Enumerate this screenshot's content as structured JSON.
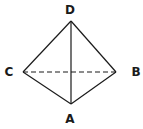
{
  "diagram": {
    "type": "tetrahedron",
    "colors": {
      "stroke": "#1a1a1a",
      "background": "#ffffff"
    },
    "vertices": [
      {
        "id": "D",
        "label": "D",
        "x": 71,
        "y": 21,
        "label_x": 70,
        "label_y": 14
      },
      {
        "id": "C",
        "label": "C",
        "x": 23,
        "y": 72,
        "label_x": 9,
        "label_y": 76
      },
      {
        "id": "B",
        "label": "B",
        "x": 116,
        "y": 72,
        "label_x": 136,
        "label_y": 76
      },
      {
        "id": "A",
        "label": "A",
        "x": 71,
        "y": 104,
        "label_x": 70,
        "label_y": 123
      }
    ],
    "edges": [
      {
        "from": "D",
        "to": "C",
        "style": "solid"
      },
      {
        "from": "D",
        "to": "B",
        "style": "solid"
      },
      {
        "from": "D",
        "to": "A",
        "style": "solid"
      },
      {
        "from": "C",
        "to": "A",
        "style": "solid"
      },
      {
        "from": "B",
        "to": "A",
        "style": "solid"
      },
      {
        "from": "C",
        "to": "B",
        "style": "dashed"
      }
    ]
  }
}
